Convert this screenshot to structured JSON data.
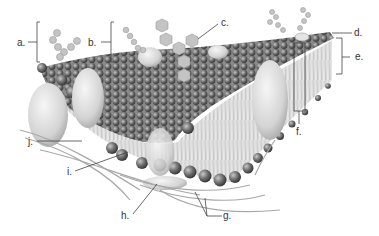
{
  "diagram": {
    "labels": [
      {
        "key": "a",
        "text": "a.",
        "x": 17,
        "y": 38
      },
      {
        "key": "b",
        "text": "b.",
        "x": 88,
        "y": 38
      },
      {
        "key": "c",
        "text": "c.",
        "x": 221,
        "y": 18
      },
      {
        "key": "d",
        "text": "d.",
        "x": 354,
        "y": 28
      },
      {
        "key": "e",
        "text": "e.",
        "x": 355,
        "y": 52
      },
      {
        "key": "f",
        "text": "f.",
        "x": 296,
        "y": 127
      },
      {
        "key": "g",
        "text": "g.",
        "x": 223,
        "y": 211
      },
      {
        "key": "h",
        "text": "h.",
        "x": 121,
        "y": 211
      },
      {
        "key": "i",
        "text": "i.",
        "x": 67,
        "y": 167
      },
      {
        "key": "j",
        "text": "j.",
        "x": 28,
        "y": 137
      }
    ],
    "colors": {
      "label_text": "#333333",
      "leader_line": "#444444",
      "phospholipid_head": "#6e6e6e",
      "protein": "#d6d6d6",
      "background": "#ffffff"
    }
  }
}
